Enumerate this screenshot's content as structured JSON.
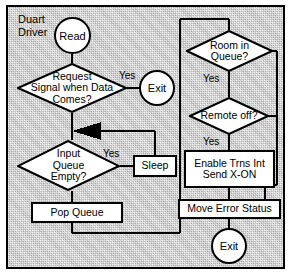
{
  "diagram": {
    "title": "Duart\nDriver",
    "title_line1": "Duart",
    "title_line2": "Driver",
    "type": "flowchart",
    "frame_color": "#000000",
    "background_color": "#b9b9b9",
    "shape_fill": "#ffffff",
    "nodes": [
      {
        "id": "read",
        "shape": "terminal",
        "label": "Read"
      },
      {
        "id": "req_signal",
        "shape": "decision",
        "label": "Request\nSignal when Data\nComes?",
        "line1": "Request",
        "line2": "Signal when Data",
        "line3": "Comes?"
      },
      {
        "id": "exit_top",
        "shape": "terminal",
        "label": "Exit"
      },
      {
        "id": "input_queue",
        "shape": "decision",
        "label": "Input\nQueue\nEmpty?",
        "line1": "Input",
        "line2": "Queue",
        "line3": "Empty?"
      },
      {
        "id": "sleep",
        "shape": "process",
        "label": "Sleep"
      },
      {
        "id": "pop_queue",
        "shape": "process",
        "label": "Pop Queue"
      },
      {
        "id": "room_queue",
        "shape": "decision",
        "label": "Room in\nQueue?",
        "line1": "Room in",
        "line2": "Queue?"
      },
      {
        "id": "remote_off",
        "shape": "decision",
        "label": "Remote off?",
        "line1": "Remote off?",
        "line2": ""
      },
      {
        "id": "enable_trns",
        "shape": "process",
        "label": "Enable Trns Int\nSend X-ON",
        "line1": "Enable Trns Int",
        "line2": "Send X-ON"
      },
      {
        "id": "move_error",
        "shape": "process",
        "label": "Move Error Status"
      },
      {
        "id": "exit_bottom",
        "shape": "terminal",
        "label": "Exit"
      }
    ],
    "edge_labels": [
      {
        "id": "yes_request",
        "text": "Yes"
      },
      {
        "id": "yes_input",
        "text": "Yes"
      },
      {
        "id": "yes_room",
        "text": "Yes"
      },
      {
        "id": "yes_remote",
        "text": "Yes"
      }
    ]
  }
}
